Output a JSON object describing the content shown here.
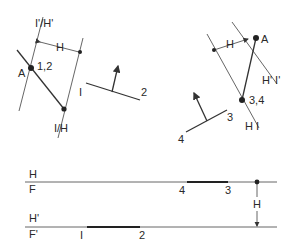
{
  "diagram": {
    "left_view": {
      "labels": {
        "top_line": "I'/H'",
        "distance": "H",
        "point_a": "A",
        "point_12": "1,2",
        "bottom_line": "I/H"
      }
    },
    "edge_12": {
      "labels": {
        "end1": "I",
        "end2": "2"
      }
    },
    "right_view": {
      "labels": {
        "distance": "H",
        "point_a": "A",
        "right_line": "H' I'",
        "point_34": "3,4",
        "bottom_line": "H I"
      }
    },
    "edge_34": {
      "labels": {
        "end3": "3",
        "end4": "4"
      }
    },
    "fold_lines": {
      "upper": {
        "top": "H",
        "bottom": "F",
        "p4": "4",
        "p3": "3"
      },
      "lower": {
        "top": "H'",
        "bottom": "F'",
        "p1": "I",
        "p2": "2"
      },
      "distance": "H"
    },
    "colors": {
      "line": "#555555",
      "bold": "#222222",
      "background": "#ffffff"
    }
  }
}
